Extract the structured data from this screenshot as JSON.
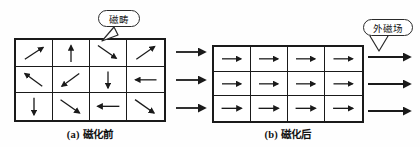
{
  "figure": {
    "background_color": "#fefefe",
    "stroke_color": "#1a1a1a"
  },
  "panel_a": {
    "caption": "(a) 磁化前",
    "callout": {
      "label": "磁畴",
      "points_to": "row1-cell3"
    },
    "grid": {
      "rows": 3,
      "cols": 4,
      "cells": [
        {
          "name": "r1c1",
          "direction": "up-right",
          "angle": -45
        },
        {
          "name": "r1c2",
          "direction": "up",
          "angle": -90
        },
        {
          "name": "r1c3",
          "direction": "down-right",
          "angle": 40
        },
        {
          "name": "r1c4",
          "direction": "up-right",
          "angle": -42
        },
        {
          "name": "r2c1",
          "direction": "up-left",
          "angle": -140
        },
        {
          "name": "r2c2",
          "direction": "down-left",
          "angle": 140
        },
        {
          "name": "r2c3",
          "direction": "down",
          "angle": 90
        },
        {
          "name": "r2c4",
          "direction": "left",
          "angle": 180
        },
        {
          "name": "r3c1",
          "direction": "down",
          "angle": 90
        },
        {
          "name": "r3c2",
          "direction": "down-right",
          "angle": 40
        },
        {
          "name": "r3c3",
          "direction": "left",
          "angle": 180
        },
        {
          "name": "r3c4",
          "direction": "down-right",
          "angle": 40
        }
      ]
    }
  },
  "panel_b": {
    "caption": "(b) 磁化后",
    "callout": {
      "label": "外磁场",
      "points_to": "external-field-arrow-1"
    },
    "grid": {
      "rows": 3,
      "cols": 4,
      "cells": [
        {
          "name": "r1c1",
          "direction": "right",
          "angle": 0
        },
        {
          "name": "r1c2",
          "direction": "right",
          "angle": 0
        },
        {
          "name": "r1c3",
          "direction": "right",
          "angle": 0
        },
        {
          "name": "r1c4",
          "direction": "right",
          "angle": 0
        },
        {
          "name": "r2c1",
          "direction": "right",
          "angle": 0
        },
        {
          "name": "r2c2",
          "direction": "right",
          "angle": 0
        },
        {
          "name": "r2c3",
          "direction": "right",
          "angle": 0
        },
        {
          "name": "r2c4",
          "direction": "right",
          "angle": 0
        },
        {
          "name": "r3c1",
          "direction": "right",
          "angle": 0
        },
        {
          "name": "r3c2",
          "direction": "right",
          "angle": 0
        },
        {
          "name": "r3c3",
          "direction": "right",
          "angle": 0
        },
        {
          "name": "r3c4",
          "direction": "right",
          "angle": 0
        }
      ]
    }
  },
  "transition_arrows": {
    "name": "process-arrows",
    "count": 3,
    "direction": "right"
  },
  "external_field_arrows": {
    "name": "external-field-arrows",
    "count": 3,
    "direction": "right"
  }
}
